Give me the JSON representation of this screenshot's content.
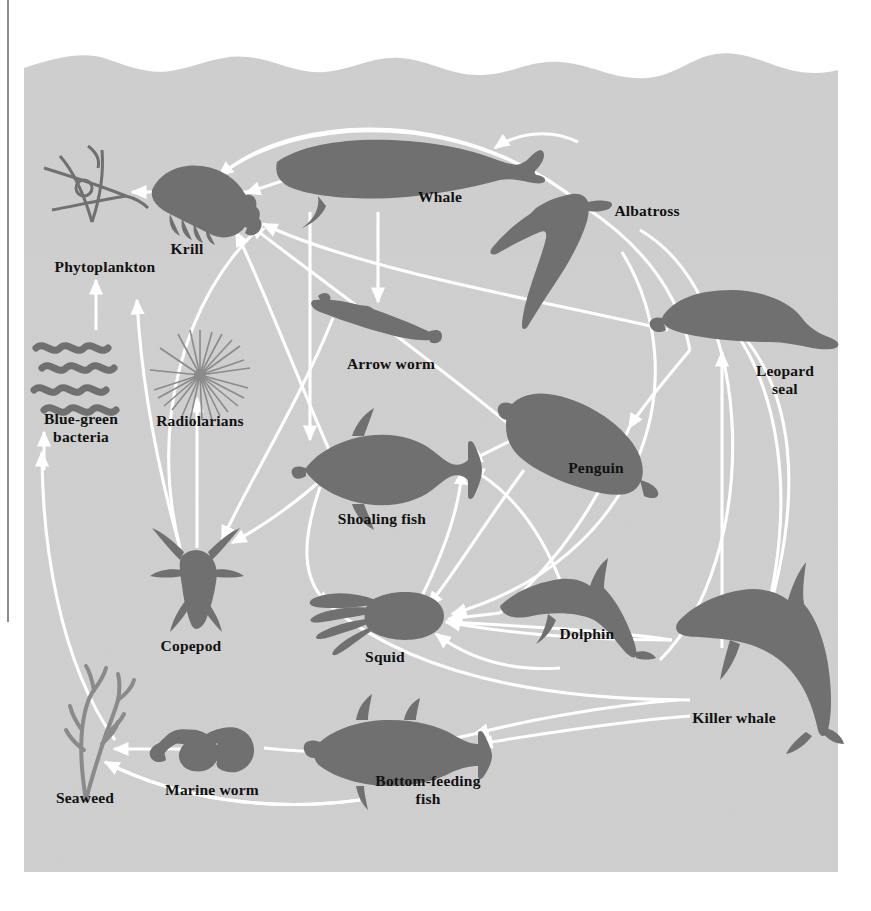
{
  "figure": {
    "kind": "antarctic-marine-food-web-diagram",
    "background_color": "#ffffff",
    "water_color": "#cfcfcf",
    "silhouette_color": "#707070",
    "arrow_color": "#ffffff",
    "label_color": "#111111",
    "panel": {
      "x": 24,
      "y": 28,
      "width": 814,
      "height": 844
    }
  },
  "organisms": [
    {
      "id": "phytoplankton",
      "label": "Phytoplankton",
      "label_x": 105,
      "label_y": 258,
      "icon": "phytoplankton-icon"
    },
    {
      "id": "krill",
      "label": "Krill",
      "label_x": 187,
      "label_y": 240,
      "icon": "krill-icon"
    },
    {
      "id": "whale",
      "label": "Whale",
      "label_x": 440,
      "label_y": 188,
      "icon": "whale-icon"
    },
    {
      "id": "albatross",
      "label": "Albatross",
      "label_x": 647,
      "label_y": 202,
      "icon": "albatross-icon"
    },
    {
      "id": "arrow-worm",
      "label": "Arrow worm",
      "label_x": 391,
      "label_y": 355,
      "icon": "arrow-worm-icon"
    },
    {
      "id": "leopard-seal",
      "label": "Leopard\nseal",
      "label_x": 785,
      "label_y": 362,
      "icon": "leopard-seal-icon"
    },
    {
      "id": "blue-green-bacteria",
      "label": "Blue-green\nbacteria",
      "label_x": 81,
      "label_y": 410,
      "icon": "blue-green-bacteria-icon"
    },
    {
      "id": "radiolarians",
      "label": "Radiolarians",
      "label_x": 200,
      "label_y": 412,
      "icon": "radiolarians-icon"
    },
    {
      "id": "penguin",
      "label": "Penguin",
      "label_x": 596,
      "label_y": 459,
      "icon": "penguin-icon"
    },
    {
      "id": "shoaling-fish",
      "label": "Shoaling fish",
      "label_x": 382,
      "label_y": 510,
      "icon": "shoaling-fish-icon"
    },
    {
      "id": "copepod",
      "label": "Copepod",
      "label_x": 191,
      "label_y": 637,
      "icon": "copepod-icon"
    },
    {
      "id": "squid",
      "label": "Squid",
      "label_x": 385,
      "label_y": 648,
      "icon": "squid-icon"
    },
    {
      "id": "dolphin",
      "label": "Dolphin",
      "label_x": 587,
      "label_y": 625,
      "icon": "dolphin-icon"
    },
    {
      "id": "killer-whale",
      "label": "Killer whale",
      "label_x": 734,
      "label_y": 709,
      "icon": "killer-whale-icon"
    },
    {
      "id": "seaweed",
      "label": "Seaweed",
      "label_x": 85,
      "label_y": 789,
      "icon": "seaweed-icon"
    },
    {
      "id": "marine-worm",
      "label": "Marine worm",
      "label_x": 212,
      "label_y": 781,
      "icon": "marine-worm-icon"
    },
    {
      "id": "bottom-feeding-fish",
      "label": "Bottom-feeding\nfish",
      "label_x": 428,
      "label_y": 772,
      "icon": "bottom-feeding-fish-icon"
    }
  ],
  "food_web_links": [
    {
      "from": "krill",
      "to": "phytoplankton"
    },
    {
      "from": "whale",
      "to": "krill"
    },
    {
      "from": "whale",
      "to": "shoaling-fish"
    },
    {
      "from": "whale",
      "to": "arrow-worm"
    },
    {
      "from": "albatross",
      "to": "whale"
    },
    {
      "from": "albatross",
      "to": "krill"
    },
    {
      "from": "albatross",
      "to": "squid"
    },
    {
      "from": "arrow-worm",
      "to": "copepod"
    },
    {
      "from": "copepod",
      "to": "radiolarians"
    },
    {
      "from": "copepod",
      "to": "phytoplankton"
    },
    {
      "from": "radiolarians",
      "to": "phytoplankton"
    },
    {
      "from": "blue-green-bacteria",
      "to": "phytoplankton"
    },
    {
      "from": "shoaling-fish",
      "to": "krill"
    },
    {
      "from": "shoaling-fish",
      "to": "copepod"
    },
    {
      "from": "shoaling-fish",
      "to": "squid"
    },
    {
      "from": "penguin",
      "to": "krill"
    },
    {
      "from": "penguin",
      "to": "shoaling-fish"
    },
    {
      "from": "penguin",
      "to": "squid"
    },
    {
      "from": "leopard-seal",
      "to": "penguin"
    },
    {
      "from": "leopard-seal",
      "to": "krill"
    },
    {
      "from": "squid",
      "to": "shoaling-fish"
    },
    {
      "from": "dolphin",
      "to": "squid"
    },
    {
      "from": "dolphin",
      "to": "shoaling-fish"
    },
    {
      "from": "killer-whale",
      "to": "leopard-seal"
    },
    {
      "from": "killer-whale",
      "to": "penguin"
    },
    {
      "from": "killer-whale",
      "to": "squid"
    },
    {
      "from": "killer-whale",
      "to": "bottom-feeding-fish"
    },
    {
      "from": "bottom-feeding-fish",
      "to": "marine-worm"
    },
    {
      "from": "marine-worm",
      "to": "seaweed"
    },
    {
      "from": "bottom-feeding-fish",
      "to": "seaweed"
    },
    {
      "from": "seaweed",
      "to": "blue-green-bacteria"
    }
  ]
}
